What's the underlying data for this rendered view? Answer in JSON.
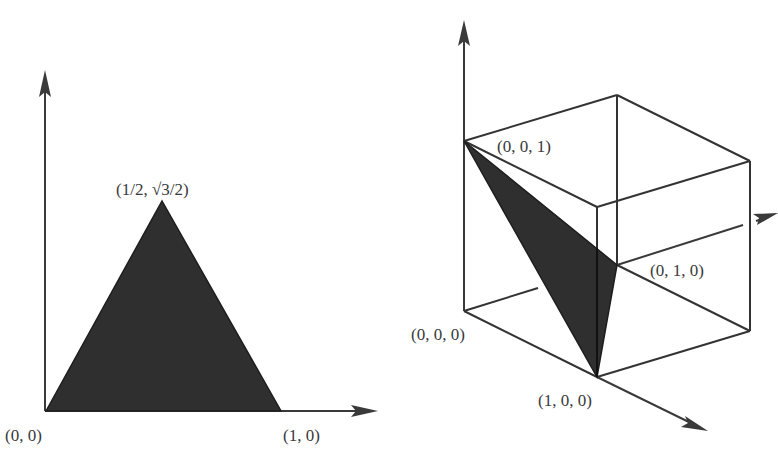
{
  "figures": [
    {
      "id": "simplex-2d",
      "description": "2-simplex drawn as an equilateral triangle in the plane",
      "labels": {
        "origin": "(0, 0)",
        "x_unit": "(1, 0)",
        "apex": "(1/2, √3/2)"
      }
    },
    {
      "id": "simplex-3d",
      "description": "2-simplex drawn inside the unit cube in 3D",
      "labels": {
        "origin": "(0, 0, 0)",
        "e1": "(1, 0, 0)",
        "e2": "(0, 1, 0)",
        "e3": "(0, 0, 1)"
      }
    }
  ],
  "colors": {
    "fill": "#2f2f2f",
    "line": "#333333",
    "text": "#3a3a3a",
    "background": "#ffffff"
  }
}
